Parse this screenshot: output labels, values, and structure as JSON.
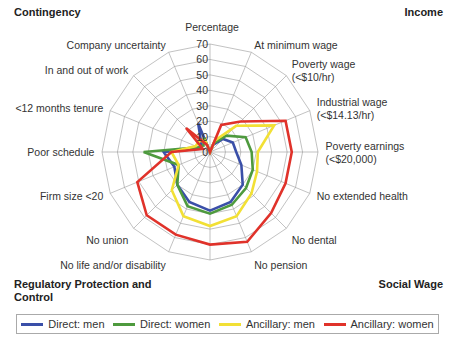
{
  "quadrants": {
    "top_left": "Contingency",
    "top_right": "Income",
    "bottom_left": "Regulatory Protection and Control",
    "bottom_right": "Social Wage"
  },
  "chart_data": {
    "type": "radar",
    "axis_title": "Percentage",
    "rlim": [
      0,
      70
    ],
    "rticks": [
      0,
      10,
      20,
      30,
      40,
      50,
      60,
      70
    ],
    "grid": true,
    "legend_position": "bottom",
    "categories": [
      "",
      "At minimum wage",
      "Poverty wage (<$10/hr)",
      "Industrial wage (<$14.13/hr)",
      "Poverty earnings (<$20,000)",
      "No extended health",
      "No dental",
      "No pension",
      "",
      "No life and/or disability",
      "No union",
      "Firm size <20",
      "Poor schedule",
      "<12 months tenure",
      "In and out of work",
      "Company uncertainty"
    ],
    "series": [
      {
        "name": "Direct: men",
        "color": "#3a4fa8",
        "values": [
          0,
          5,
          12,
          16,
          17,
          22,
          30,
          35,
          38,
          35,
          30,
          25,
          30,
          6,
          8,
          20
        ]
      },
      {
        "name": "Direct: women",
        "color": "#4e9a3e",
        "values": [
          0,
          6,
          15,
          25,
          27,
          30,
          33,
          37,
          40,
          38,
          30,
          22,
          43,
          8,
          6,
          10
        ]
      },
      {
        "name": "Ancillary: men",
        "color": "#f2e035",
        "values": [
          0,
          8,
          24,
          45,
          31,
          33,
          38,
          45,
          48,
          45,
          35,
          22,
          25,
          10,
          10,
          8
        ]
      },
      {
        "name": "Ancillary: women",
        "color": "#e0322a",
        "values": [
          0,
          19,
          28,
          53,
          53,
          53,
          56,
          63,
          60,
          58,
          58,
          51,
          25,
          5,
          22,
          5
        ]
      }
    ]
  }
}
